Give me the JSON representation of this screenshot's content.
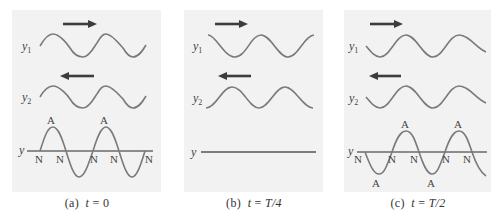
{
  "figure": {
    "panels": [
      {
        "id": "a",
        "caption_prefix": "(a)",
        "caption_var": "t",
        "caption_eq": "=",
        "caption_value": "0",
        "wave1_label": "y",
        "wave1_sub": "1",
        "wave1_direction": "right",
        "wave2_label": "y",
        "wave2_sub": "2",
        "wave2_direction": "left",
        "resultant_label": "y",
        "resultant_state": "maximum displacement, antinodes at crests",
        "antinode_label": "A",
        "node_label": "N",
        "antinode_count": 2,
        "node_count": 5
      },
      {
        "id": "b",
        "caption_prefix": "(b)",
        "caption_var": "t",
        "caption_eq": "=",
        "caption_value": "T/4",
        "wave1_label": "y",
        "wave1_sub": "1",
        "wave1_direction": "right",
        "wave2_label": "y",
        "wave2_sub": "2",
        "wave2_direction": "left",
        "resultant_label": "y",
        "resultant_state": "flat (waves cancel)"
      },
      {
        "id": "c",
        "caption_prefix": "(c)",
        "caption_var": "t",
        "caption_eq": "=",
        "caption_value": "T/2",
        "wave1_label": "y",
        "wave1_sub": "1",
        "wave1_direction": "right",
        "wave2_label": "y",
        "wave2_sub": "2",
        "wave2_direction": "left",
        "resultant_label": "y",
        "resultant_state": "inverted maximum displacement",
        "antinode_label": "A",
        "node_label": "N",
        "antinode_count": 4,
        "node_count": 5
      }
    ],
    "colors": {
      "panel_background": "#f2f2f2",
      "wave": "#7a7a7a",
      "arrow": "#3c3c3c",
      "text": "#444444"
    }
  }
}
